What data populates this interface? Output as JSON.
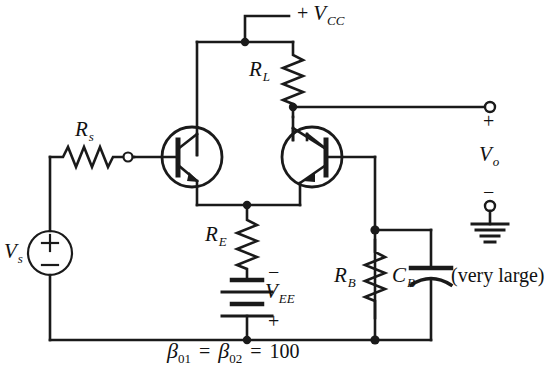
{
  "figure": {
    "type": "circuit-schematic",
    "background_color": "#ffffff",
    "line_color": "#1a1a1a"
  },
  "labels": {
    "supply": {
      "sign": "+",
      "symbol": "V",
      "subscript": "CC"
    },
    "load_resistor": {
      "symbol": "R",
      "subscript": "L"
    },
    "source_resistor": {
      "symbol": "R",
      "subscript": "s"
    },
    "emitter_resistor": {
      "symbol": "R",
      "subscript": "E"
    },
    "base_resistor": {
      "symbol": "R",
      "subscript": "B"
    },
    "bypass_capacitor": {
      "symbol": "C",
      "subscript": "B"
    },
    "capacitor_note": "(very large)",
    "source_voltage": {
      "symbol": "V",
      "subscript": "s"
    },
    "output_voltage": {
      "symbol": "V",
      "subscript": "o"
    },
    "negative_supply": {
      "symbol": "V",
      "subscript": "EE"
    },
    "output_plus": "+",
    "output_minus": "−",
    "vee_minus": "−",
    "vee_plus": "+",
    "source_plus": "+",
    "source_minus": "−"
  },
  "annotation": {
    "beta_equation": "β",
    "beta1_sub": "01",
    "beta2_sub": "02",
    "equals1": "=",
    "equals2": "=",
    "beta_value": "100",
    "full_text": "β01 = β02 = 100"
  },
  "components": [
    {
      "name": "transistor-q1",
      "kind": "npn-bjt",
      "orientation": "base-left"
    },
    {
      "name": "transistor-q2",
      "kind": "npn-bjt",
      "orientation": "base-right"
    },
    {
      "name": "resistor-rl",
      "kind": "resistor",
      "orientation": "vertical"
    },
    {
      "name": "resistor-rs",
      "kind": "resistor",
      "orientation": "horizontal"
    },
    {
      "name": "resistor-re",
      "kind": "resistor",
      "orientation": "vertical"
    },
    {
      "name": "resistor-rb",
      "kind": "resistor",
      "orientation": "vertical"
    },
    {
      "name": "capacitor-cb",
      "kind": "polarized-capacitor",
      "orientation": "vertical"
    },
    {
      "name": "battery-vee",
      "kind": "battery-cell-stack",
      "cells": 2
    },
    {
      "name": "source-vs",
      "kind": "voltage-source-circle"
    },
    {
      "name": "ground-symbol",
      "kind": "earth-ground"
    },
    {
      "name": "terminal-output-top",
      "kind": "open-terminal"
    },
    {
      "name": "terminal-output-bottom",
      "kind": "open-terminal"
    },
    {
      "name": "terminal-base-input",
      "kind": "open-terminal"
    }
  ]
}
